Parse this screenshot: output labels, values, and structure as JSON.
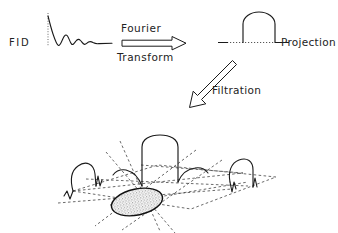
{
  "figure": {
    "background_color": "#ffffff",
    "ink_color": "#1a1a1a",
    "width": 338,
    "height": 233
  },
  "labels": {
    "fid": "FID",
    "fourier": "Fourier",
    "transform": "Transform",
    "projection": "Projection",
    "filtration": "Filtration"
  },
  "arrows": {
    "fourier_transform": {
      "name": "fourier-transform-arrow",
      "style": "hollow-outline",
      "direction": "right",
      "from": [
        122,
        43
      ],
      "to": [
        186,
        43
      ]
    },
    "filtration": {
      "name": "filtration-arrow",
      "style": "hollow-outline",
      "direction": "down-left",
      "from": [
        234,
        62
      ],
      "to": [
        190,
        106
      ]
    }
  },
  "fid_signal": {
    "name": "fid-waveform",
    "description": "damped oscillating free induction decay with dotted vertical axis",
    "baseline_y": 43,
    "axis_x": 48,
    "extent_x": [
      48,
      112
    ]
  },
  "projection_profile": {
    "name": "projection-profile",
    "description": "rounded-top rectangular profile on dotted baseline",
    "baseline_y": 42,
    "left_x": 243,
    "right_x": 275,
    "top_y": 13,
    "dotted_baseline_extent": [
      218,
      288
    ]
  },
  "backprojection": {
    "name": "filtered-backprojection-diagram",
    "description": "three filtered projection profiles arranged on a dashed perspective plane around a stippled elliptical object",
    "object": {
      "name": "stippled-ellipse-object",
      "center": [
        137,
        202
      ],
      "rx": 26,
      "ry": 13,
      "rotation_deg": -12,
      "fill": "stipple"
    },
    "profiles": [
      {
        "name": "profile-left",
        "base": [
          93,
          178
        ],
        "width": 27,
        "height": 32,
        "rotation_deg": -4
      },
      {
        "name": "profile-center",
        "base": [
          166,
          165
        ],
        "width": 36,
        "height": 40,
        "rotation_deg": 0
      },
      {
        "name": "profile-right",
        "base": [
          248,
          175
        ],
        "width": 21,
        "height": 31,
        "rotation_deg": 2
      }
    ],
    "plane": {
      "name": "dashed-projection-plane",
      "style": "dashed",
      "vertices": [
        [
          73,
          192
        ],
        [
          160,
          166
        ],
        [
          276,
          178
        ],
        [
          190,
          208
        ]
      ]
    }
  }
}
